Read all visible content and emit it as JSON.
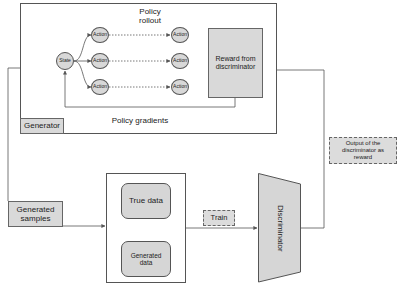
{
  "generator": {
    "label": "Generator",
    "policy_rollout_label": "Policy\nrollout",
    "policy_gradients_label": "Policy gradients",
    "state_label": "State",
    "actions": [
      {
        "label": "Action"
      },
      {
        "label": "Action"
      },
      {
        "label": "Action"
      },
      {
        "label": "Action"
      },
      {
        "label": "Action"
      },
      {
        "label": "Action"
      }
    ],
    "reward_label": "Reward from discriminator"
  },
  "generated_samples_label": "Generated samples",
  "data_box": {
    "true_data_label": "True data",
    "generated_data_label": "Generated data"
  },
  "train_label": "Train",
  "discriminator_label": "Discriminator",
  "output_label": "Output of the discriminator as reward",
  "colors": {
    "node_fill": "#d8d8d8",
    "line": "#555555",
    "background": "#ffffff"
  }
}
